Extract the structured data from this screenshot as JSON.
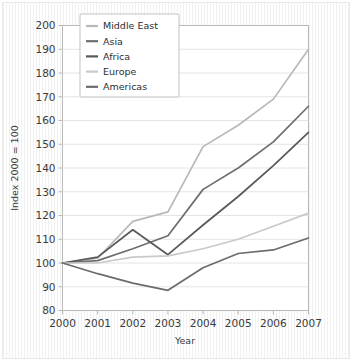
{
  "chart_data": {
    "type": "line",
    "title": "",
    "xlabel": "Year",
    "ylabel": "Index 2000 = 100",
    "x": [
      2000,
      2001,
      2002,
      2003,
      2004,
      2005,
      2006,
      2007
    ],
    "xtick_labels": [
      "2000",
      "2001",
      "2002",
      "2003",
      "2004",
      "2005",
      "2006",
      "2007"
    ],
    "ytick_labels": [
      "80",
      "90",
      "100",
      "110",
      "120",
      "130",
      "140",
      "150",
      "160",
      "170",
      "180",
      "190",
      "200"
    ],
    "ytick_values": [
      80,
      90,
      100,
      110,
      120,
      130,
      140,
      150,
      160,
      170,
      180,
      190,
      200
    ],
    "xlim": [
      2000,
      2007
    ],
    "ylim": [
      80,
      200
    ],
    "grid": true,
    "grid_axis": "y",
    "legend_position": "upper-left",
    "series": [
      {
        "name": "Middle East",
        "color": "#b8b8b8",
        "values": [
          100,
          102,
          117.5,
          121.5,
          149,
          158,
          169,
          190
        ]
      },
      {
        "name": "Asia",
        "color": "#6e6e6e",
        "values": [
          100,
          101,
          106,
          111.5,
          131,
          140,
          151,
          166
        ]
      },
      {
        "name": "Africa",
        "color": "#585858",
        "values": [
          100,
          102.5,
          114,
          103.5,
          116,
          128,
          141,
          155
        ]
      },
      {
        "name": "Europe",
        "color": "#c9c9c9",
        "values": [
          100,
          100,
          102.5,
          103,
          106,
          110,
          115.5,
          121
        ]
      },
      {
        "name": "Americas",
        "color": "#6b6b6b",
        "values": [
          100,
          95.5,
          91.5,
          88.5,
          98,
          104,
          105.5,
          110.5
        ]
      }
    ]
  },
  "colors": {
    "plot_background": "#ffffff",
    "figure_background": "#ffffff",
    "grid": "#e4e4e4",
    "axis_line": "#b9b9b9",
    "tick_text": "#3a3a3a",
    "legend_border": "#c2c2c2"
  }
}
